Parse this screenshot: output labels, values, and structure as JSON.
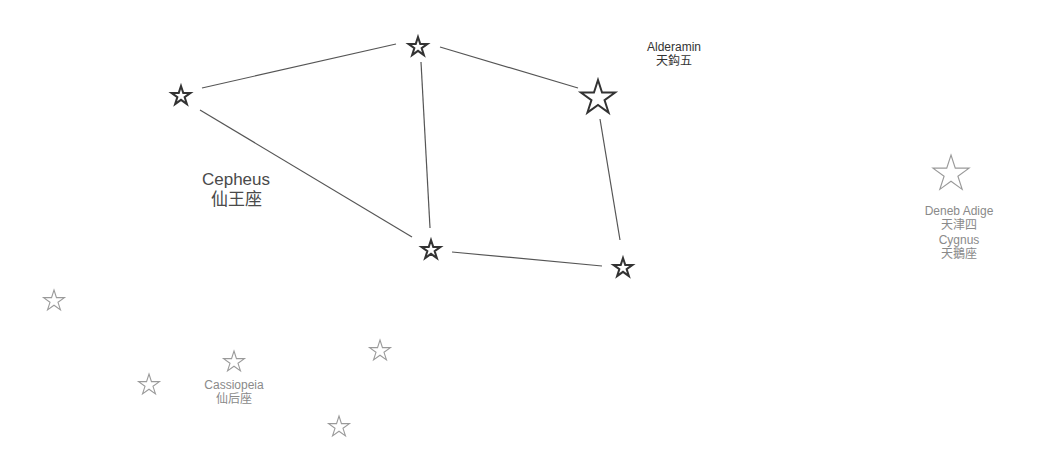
{
  "constellations": {
    "cepheus": {
      "name_en": "Cepheus",
      "name_zh": "仙王座"
    },
    "cassiopeia": {
      "name_en": "Cassiopeia",
      "name_zh": "仙后座"
    },
    "cygnus": {
      "name_en": "Cygnus",
      "name_zh": "天鵝座"
    }
  },
  "stars": {
    "alderamin": {
      "name_en": "Alderamin",
      "name_zh": "天鈎五"
    },
    "deneb_adige": {
      "name_en": "Deneb Adige",
      "name_zh": "天津四"
    }
  },
  "colors": {
    "main_line": "#555555",
    "main_star": "#333333",
    "faint_star": "#9a9a9a"
  }
}
